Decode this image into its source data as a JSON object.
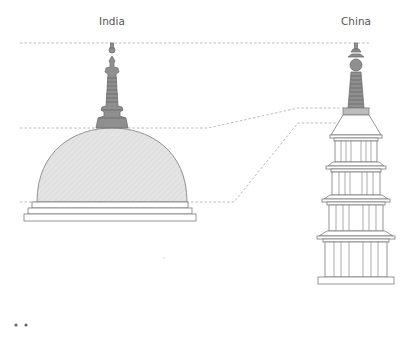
{
  "diagram": {
    "structures": [
      {
        "id": "india",
        "label": "India",
        "type": "stupa"
      },
      {
        "id": "china",
        "label": "China",
        "type": "pagoda"
      }
    ],
    "guide_lines": [
      {
        "name": "finial-top",
        "connects": [
          "india",
          "china"
        ]
      },
      {
        "name": "spire-base",
        "connects": [
          "india",
          "china"
        ]
      },
      {
        "name": "dome-base-to-roof",
        "connects": [
          "india",
          "china"
        ]
      }
    ],
    "pagoda_tiers": 4,
    "colors": {
      "spire": "#8f8f8f",
      "dome": "#e4e4e4",
      "outline": "#7a7a7a",
      "guide": "#aaaaaa"
    },
    "pager": {
      "dots": 2
    }
  }
}
